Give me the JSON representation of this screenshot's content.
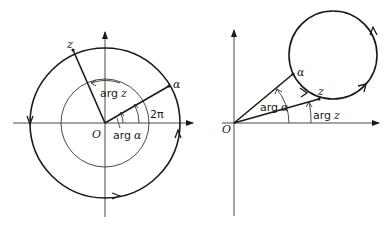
{
  "figures": [
    {
      "id": "left",
      "description": "Point z traverses a circle centred at the origin enclosing O; arg z increases by 2π",
      "labels": {
        "z": "z",
        "alpha": "α",
        "origin": "O",
        "arg_z": "arg",
        "arg_z_var": "z",
        "arg_alpha": "arg",
        "arg_alpha_var": "α",
        "two_pi": "2π"
      }
    },
    {
      "id": "right",
      "description": "Point z traverses a circle not enclosing O; arg z returns to its initial value",
      "labels": {
        "z": "z",
        "alpha": "α",
        "origin": "O",
        "arg_alpha": "arg",
        "arg_alpha_var": "α",
        "arg_z": "arg",
        "arg_z_var": "z"
      }
    }
  ],
  "colors": {
    "stroke": "#1a1a1a",
    "thin_stroke": "#333333",
    "background": "#ffffff"
  }
}
